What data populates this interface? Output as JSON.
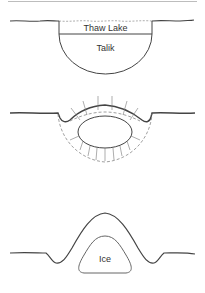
{
  "figure": {
    "panels": [
      {
        "id": "panel-1",
        "description": "Thaw lake over talik",
        "labels": {
          "lake": "Thaw Lake",
          "talik": "Talik"
        }
      },
      {
        "id": "panel-2",
        "description": "Refreezing talik with inward freezing arrows"
      },
      {
        "id": "panel-3",
        "description": "Pingo with ice core",
        "labels": {
          "ice": "Ice"
        }
      }
    ],
    "colors": {
      "line": "#444444",
      "dashed": "#888888",
      "background": "#ffffff"
    }
  }
}
